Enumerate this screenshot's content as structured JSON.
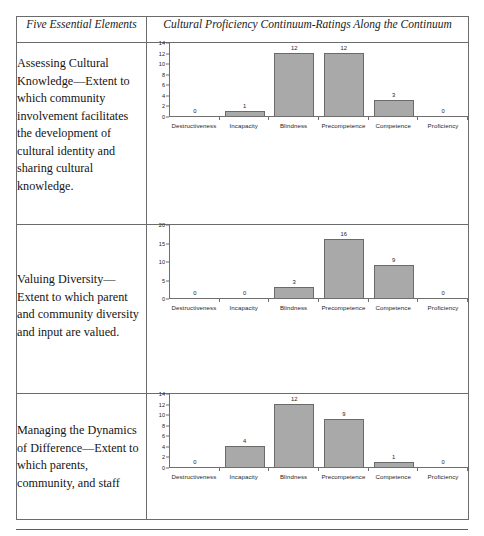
{
  "table": {
    "headers": {
      "left": "Five Essential Elements",
      "right": "Cultural Proficiency Continuum-Ratings Along the Continuum"
    },
    "rows": [
      {
        "element": "Assessing Cultural Knowledge—Extent to which community involvement facilitates the development of cultural identity and sharing cultural knowledge."
      },
      {
        "element": "Valuing Diversity—Extent to which parent and community diversity and input are valued."
      },
      {
        "element": "Managing the Dynamics of Difference—Extent to which parents, community, and staff"
      }
    ]
  },
  "chart_data": [
    {
      "type": "bar",
      "title": "Assessing Cultural Knowledge",
      "categories": [
        "Destructiveness",
        "Incapacity",
        "Blindness",
        "Precompetence",
        "Competence",
        "Proficiency"
      ],
      "values": [
        0,
        1,
        12,
        12,
        3,
        0
      ],
      "yticks": [
        0,
        2,
        4,
        6,
        8,
        10,
        12,
        14
      ],
      "ylim": [
        0,
        14
      ],
      "xlabel": "",
      "ylabel": "",
      "grid": false,
      "legend": false,
      "data_labels": [
        "0",
        "1",
        "12",
        "12",
        "3",
        "0"
      ],
      "bar_color": "#a9a9a9",
      "bar_border_color": "#6a6a6a"
    },
    {
      "type": "bar",
      "title": "Valuing Diversity",
      "categories": [
        "Destructiveness",
        "Incapacity",
        "Blindness",
        "Precompetence",
        "Competence",
        "Proficiency"
      ],
      "values": [
        0,
        0,
        3,
        16,
        9,
        0
      ],
      "yticks": [
        0,
        5,
        10,
        15,
        20
      ],
      "ylim": [
        0,
        20
      ],
      "xlabel": "",
      "ylabel": "",
      "grid": false,
      "legend": false,
      "data_labels": [
        "0",
        "0",
        "3",
        "16",
        "9",
        "0"
      ],
      "bar_color": "#a9a9a9",
      "bar_border_color": "#6a6a6a"
    },
    {
      "type": "bar",
      "title": "Managing the Dynamics of Difference",
      "categories": [
        "Destructiveness",
        "Incapacity",
        "Blindness",
        "Precompetence",
        "Competence",
        "Proficiency"
      ],
      "values": [
        0,
        4,
        12,
        9,
        1,
        0
      ],
      "yticks": [
        0,
        2,
        4,
        6,
        8,
        10,
        12,
        14
      ],
      "ylim": [
        0,
        14
      ],
      "xlabel": "",
      "ylabel": "",
      "grid": false,
      "legend": false,
      "data_labels": [
        "0",
        "4",
        "12",
        "9",
        "1",
        "0"
      ],
      "bar_color": "#a9a9a9",
      "bar_border_color": "#6a6a6a"
    }
  ]
}
